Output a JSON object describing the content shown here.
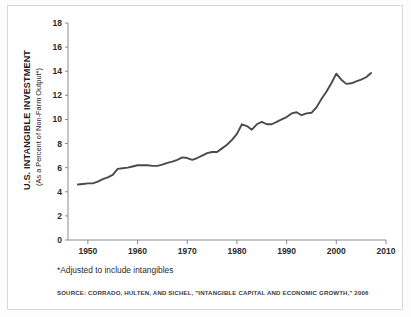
{
  "figure": {
    "footnote": "*Adjusted to include intangibles",
    "source": "SOURCE: CORRADO, HULTEN, AND SICHEL, \"INTANGIBLE CAPITAL AND ECONOMIC GROWTH,\" 2006",
    "ylabel_line1": "U.S. INTANGIBLE INVESTMENT",
    "ylabel_line2": "(As a Percent of Non-Farm Output*)",
    "line_color": "#4a4a4a",
    "axis_color": "#8a8a8a",
    "background": "#ffffff"
  },
  "chart_data": {
    "type": "line",
    "title": "",
    "subtitle": "",
    "xlabel": "",
    "ylabel": "U.S. INTANGIBLE INVESTMENT (As a Percent of Non-Farm Output*)",
    "xlim": [
      1946,
      2010
    ],
    "ylim": [
      0,
      18
    ],
    "xticks": [
      1950,
      1960,
      1970,
      1980,
      1990,
      2000,
      2010
    ],
    "yticks": [
      0,
      2,
      4,
      6,
      8,
      10,
      12,
      14,
      16,
      18
    ],
    "grid": false,
    "legend": false,
    "series": [
      {
        "name": "U.S. Intangible Investment (% of Non-Farm Output)",
        "x": [
          1948,
          1949,
          1950,
          1951,
          1952,
          1953,
          1954,
          1955,
          1956,
          1957,
          1958,
          1959,
          1960,
          1961,
          1962,
          1963,
          1964,
          1965,
          1966,
          1967,
          1968,
          1969,
          1970,
          1971,
          1972,
          1973,
          1974,
          1975,
          1976,
          1977,
          1978,
          1979,
          1980,
          1981,
          1982,
          1983,
          1984,
          1985,
          1986,
          1987,
          1988,
          1989,
          1990,
          1991,
          1992,
          1993,
          1994,
          1995,
          1996,
          1997,
          1998,
          1999,
          2000,
          2001,
          2002,
          2003,
          2004,
          2005,
          2006,
          2007
        ],
        "values": [
          4.6,
          4.65,
          4.7,
          4.7,
          4.85,
          5.05,
          5.2,
          5.4,
          5.9,
          5.95,
          6.0,
          6.1,
          6.2,
          6.2,
          6.2,
          6.15,
          6.15,
          6.25,
          6.4,
          6.5,
          6.65,
          6.85,
          6.8,
          6.65,
          6.8,
          7.0,
          7.2,
          7.3,
          7.3,
          7.6,
          7.9,
          8.3,
          8.8,
          9.6,
          9.45,
          9.15,
          9.6,
          9.8,
          9.6,
          9.6,
          9.8,
          10.0,
          10.2,
          10.5,
          10.6,
          10.35,
          10.5,
          10.55,
          11.0,
          11.7,
          12.3,
          13.0,
          13.8,
          13.3,
          12.95,
          13.0,
          13.15,
          13.3,
          13.5,
          13.85
        ]
      }
    ]
  }
}
